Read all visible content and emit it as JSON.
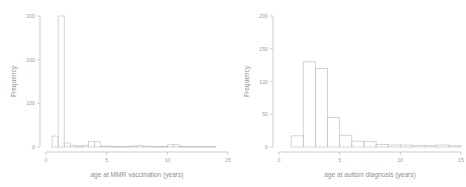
{
  "figure": {
    "background": "#ffffff",
    "stroke_color": "#c2c2c2",
    "text_color": "#9d9d9d",
    "panels": [
      "mmr",
      "autism"
    ]
  },
  "chart_data": [
    {
      "type": "bar",
      "id": "mmr-histogram",
      "title": "",
      "xlabel": "age at MMR vaccination (years)",
      "ylabel": "Frequency",
      "xlim": [
        0,
        15
      ],
      "ylim": [
        0,
        300
      ],
      "xticks": [
        0,
        5,
        10,
        15
      ],
      "xticklabels": [
        "0",
        "5",
        "10",
        "15"
      ],
      "yticks": [
        0,
        100,
        200,
        300
      ],
      "yticklabels": [
        "0",
        "100",
        "200",
        "300"
      ],
      "grid": false,
      "legend": "none",
      "bin_width": 0.5,
      "bin_edges": [
        0.5,
        1.0,
        1.5,
        2.0,
        2.5,
        3.0,
        3.5,
        4.0,
        4.5,
        5.0,
        5.5,
        6.0,
        6.5,
        7.0,
        7.5,
        8.0,
        8.5,
        9.0,
        9.5,
        10.0,
        10.5,
        11.0,
        11.5,
        12.0,
        12.5,
        13.0,
        13.5,
        14.0
      ],
      "values": [
        25,
        300,
        9,
        3,
        2,
        4,
        12,
        12,
        2,
        2,
        1,
        1,
        1,
        2,
        3,
        2,
        1,
        1,
        1,
        5,
        5,
        1,
        1,
        1,
        1,
        1,
        1
      ]
    },
    {
      "type": "bar",
      "id": "autism-histogram",
      "title": "",
      "xlabel": "age at autism diagnosis (years)",
      "ylabel": "Frequency",
      "xlim": [
        0,
        15
      ],
      "ylim": [
        0,
        200
      ],
      "xticks": [
        0,
        5,
        10,
        15
      ],
      "xticklabels": [
        "0",
        "5",
        "10",
        "15"
      ],
      "yticks": [
        0,
        50,
        100,
        150,
        200
      ],
      "yticklabels": [
        "0",
        "50",
        "100",
        "150",
        "200"
      ],
      "grid": false,
      "legend": "none",
      "bin_width": 1,
      "bin_edges": [
        1,
        2,
        3,
        4,
        5,
        6,
        7,
        8,
        9,
        10,
        11,
        12,
        13,
        14,
        15
      ],
      "values": [
        17,
        130,
        120,
        45,
        18,
        9,
        8,
        4,
        3,
        3,
        2,
        2,
        3,
        2
      ]
    }
  ]
}
